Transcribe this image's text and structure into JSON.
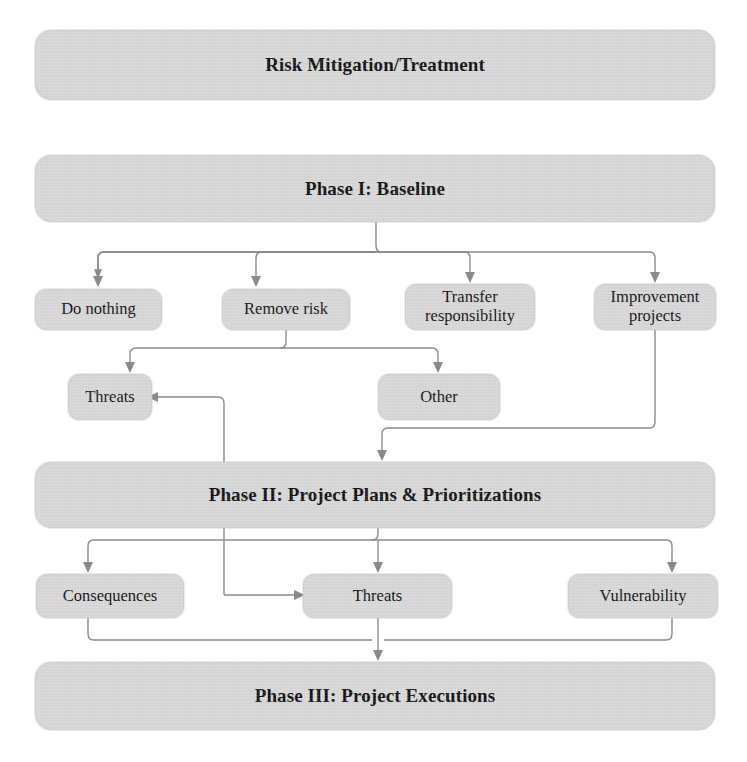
{
  "figure": {
    "title": "Risk Mitigation/Treatment",
    "kind": "flowchart",
    "colors": {
      "node_fill": "#d8d8d8",
      "node_border": "#cfcfcf",
      "edge": "#8a8a8a",
      "text": "#121212",
      "background": "#ffffff"
    }
  },
  "nodes": {
    "title_bar": {
      "label": "Risk Mitigation/Treatment"
    },
    "phase1": {
      "label": "Phase I: Baseline"
    },
    "do_nothing": {
      "label": "Do nothing"
    },
    "remove_risk": {
      "label": "Remove risk"
    },
    "transfer_responsibility": {
      "label": "Transfer\nresponsibility"
    },
    "improvement_projects": {
      "label": "Improvement\nprojects"
    },
    "threats_upper": {
      "label": "Threats"
    },
    "other": {
      "label": "Other"
    },
    "phase2": {
      "label": "Phase II: Project Plans & Prioritizations"
    },
    "consequences": {
      "label": "Consequences"
    },
    "threats_lower": {
      "label": "Threats"
    },
    "vulnerability": {
      "label": "Vulnerability"
    },
    "phase3": {
      "label": "Phase III: Project Executions"
    }
  },
  "edges": [
    {
      "from": "phase1",
      "to": "do_nothing"
    },
    {
      "from": "phase1",
      "to": "remove_risk"
    },
    {
      "from": "phase1",
      "to": "transfer_responsibility"
    },
    {
      "from": "phase1",
      "to": "improvement_projects"
    },
    {
      "from": "remove_risk",
      "to": "threats_upper"
    },
    {
      "from": "remove_risk",
      "to": "other"
    },
    {
      "from": "improvement_projects",
      "to": "phase2"
    },
    {
      "from": "phase2",
      "to": "threats_upper"
    },
    {
      "from": "phase2",
      "to": "consequences"
    },
    {
      "from": "phase2",
      "to": "threats_lower"
    },
    {
      "from": "phase2",
      "to": "vulnerability"
    },
    {
      "from": "consequences",
      "to": "phase3"
    },
    {
      "from": "threats_lower",
      "to": "phase3"
    },
    {
      "from": "vulnerability",
      "to": "phase3"
    }
  ]
}
